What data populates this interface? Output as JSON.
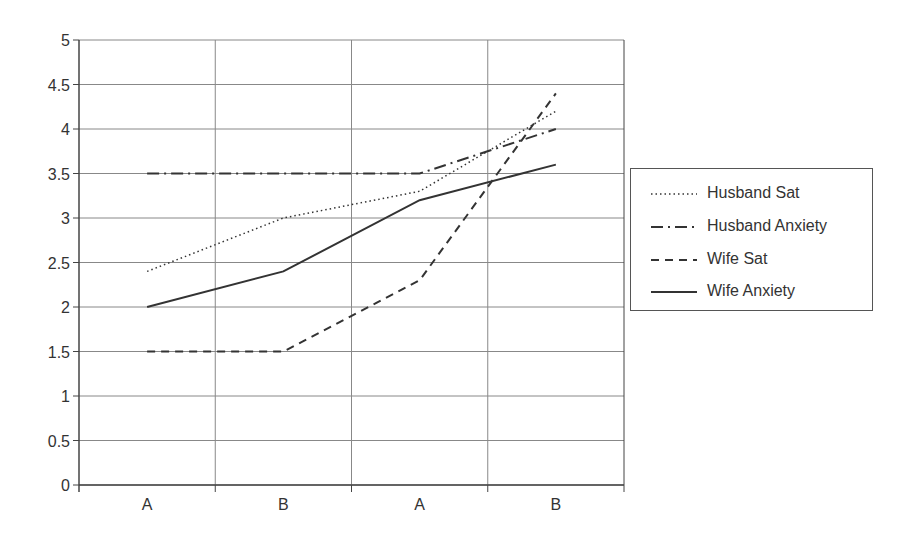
{
  "chart_data": {
    "type": "line",
    "title": "",
    "xlabel": "",
    "ylabel": "",
    "categories": [
      "A",
      "B",
      "A",
      "B"
    ],
    "ylim": [
      0,
      5
    ],
    "yticks": [
      "0",
      "0.5",
      "1",
      "1.5",
      "2",
      "2.5",
      "3",
      "3.5",
      "4",
      "4.5",
      "5"
    ],
    "grid": true,
    "legend_position": "right",
    "series": [
      {
        "name": "Husband Sat",
        "style": "dotted",
        "values": [
          2.4,
          3.0,
          3.3,
          4.2
        ]
      },
      {
        "name": "Husband Anxiety",
        "style": "dash-dot",
        "values": [
          3.5,
          3.5,
          3.5,
          4.0
        ]
      },
      {
        "name": "Wife Sat",
        "style": "dashed",
        "values": [
          1.5,
          1.5,
          2.3,
          4.4
        ]
      },
      {
        "name": "Wife Anxiety",
        "style": "solid",
        "values": [
          2.0,
          2.4,
          3.2,
          3.6
        ]
      }
    ]
  },
  "legend": {
    "items": [
      {
        "label": "Husband Sat"
      },
      {
        "label": "Husband Anxiety"
      },
      {
        "label": "Wife Sat"
      },
      {
        "label": "Wife Anxiety"
      }
    ]
  },
  "colors": {
    "line": "#333333",
    "grid": "#888888",
    "axis": "#444444"
  }
}
